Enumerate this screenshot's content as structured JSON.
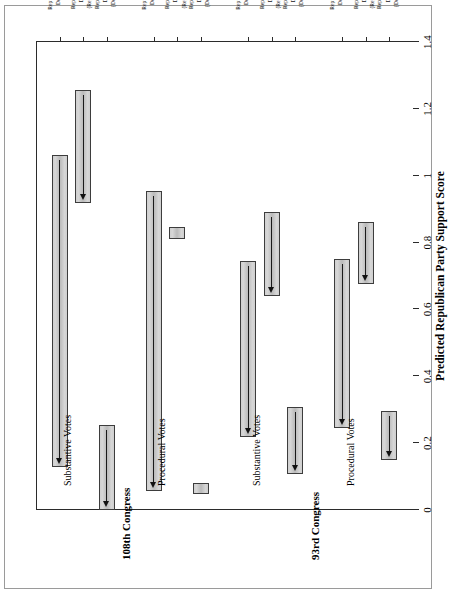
{
  "chart_data": {
    "type": "bar",
    "orientation": "horizontal-rotated",
    "title": "",
    "xlabel": "",
    "ylabel": "Predicted Republican Party Support Score",
    "ylim": [
      0,
      1.4
    ],
    "yticks": [
      0,
      0.2,
      0.4,
      0.6,
      0.8,
      1,
      1.2,
      1.4
    ],
    "ytick_labels": [
      "0",
      "0.2",
      "0.4",
      "0.6",
      "0.8",
      "1",
      "1.2",
      "1.4"
    ],
    "grid": false,
    "legend": "none",
    "panels": [
      {
        "name": "93rd Congress",
        "subpanels": [
          {
            "name": "Procedural Votes",
            "categories": [
              "Republican to\nDemocrat",
              "Rep. to Dem.\nDistrict\n(Republican)",
              "Rep. to Dem.\nDistrict\n(Democrat)"
            ],
            "intervals": [
              {
                "low": 0.245,
                "high": 0.75,
                "estimate": 0.75
              },
              {
                "low": 0.676,
                "high": 0.861,
                "estimate": 0.861
              },
              {
                "low": 0.149,
                "high": 0.297,
                "estimate": 0.297
              }
            ]
          },
          {
            "name": "Substantive Votes",
            "categories": [
              "Republican to\nDemocrat",
              "Rep. to Dem.\nDistrict\n(Republican)",
              "Rep. to Dem.\nDistrict\n(Democrat)"
            ],
            "intervals": [
              {
                "low": 0.219,
                "high": 0.746,
                "estimate": 0.746
              },
              {
                "low": 0.639,
                "high": 0.891,
                "estimate": 0.891
              },
              {
                "low": 0.108,
                "high": 0.308,
                "estimate": 0.308
              }
            ]
          }
        ]
      },
      {
        "name": "108th Congress",
        "subpanels": [
          {
            "name": "Procedural Votes",
            "categories": [
              "Republican to\nDemocrat",
              "Rep. to Dem.\nDistrict\n(Republican)",
              "Rep. to Dem.\nDistrict\n(Democrat)"
            ],
            "intervals": [
              {
                "low": 0.056,
                "high": 0.954,
                "estimate": 0.954
              },
              {
                "low": 0.81,
                "high": 0.847,
                "estimate": null
              },
              {
                "low": 0.048,
                "high": 0.082,
                "estimate": null
              }
            ]
          },
          {
            "name": "Substantive Votes",
            "categories": [
              "Republican to\nDemocrat",
              "Rep. to Dem.\nDistrict\n(Republican)",
              "Rep. to Dem.\nDistrict\n(Democrat)"
            ],
            "intervals": [
              {
                "low": 0.13,
                "high": 1.062,
                "estimate": 1.062
              },
              {
                "low": 0.917,
                "high": 1.255,
                "estimate": 1.255
              },
              {
                "low": 0.0,
                "high": 0.253,
                "estimate": 0.253
              }
            ]
          }
        ]
      }
    ]
  },
  "axis": {
    "value_title": "Predicted Republican Party Support Score",
    "ticks": [
      {
        "label": "0",
        "value": 0
      },
      {
        "label": "0.2",
        "value": 0.2
      },
      {
        "label": "0.4",
        "value": 0.4
      },
      {
        "label": "0.6",
        "value": 0.6
      },
      {
        "label": "0.8",
        "value": 0.8
      },
      {
        "label": "1",
        "value": 1
      },
      {
        "label": "1.2",
        "value": 1.2
      },
      {
        "label": "1.4",
        "value": 1.4
      }
    ]
  },
  "panels": {
    "p0_title": "93rd Congress",
    "p1_title": "108th Congress",
    "s0_title": "Procedural Votes",
    "s1_title": "Substantive Votes",
    "s2_title": "Procedural Votes",
    "s3_title": "Substantive Votes"
  },
  "categories": {
    "c0": "Republican to\nDemocrat",
    "c1": "Rep. to Dem.\nDistrict\n(Republican)",
    "c2": "Rep. to Dem.\nDistrict\n(Democrat)",
    "c3": "Republican to\nDemocrat",
    "c4": "Rep. to Dem.\nDistrict\n(Republican)",
    "c5": "Rep. to Dem.\nDistrict\n(Democrat)",
    "c6": "Republican to\nDemocrat",
    "c7": "Rep. to Dem.\nDistrict\n(Republican)",
    "c8": "Rep. to Dem.\nDistrict\n(Democrat)",
    "c9": "Republican to\nDemocrat",
    "c10": "Rep. to Dem.\nDistrict\n(Republican)",
    "c11": "Rep. to Dem.\nDistrict\n(Democrat)"
  },
  "colors": {
    "bar_fill": "#c6c6c6",
    "bar_border": "#3d3d3d",
    "axis": "#2b2b2b",
    "frame": "#9a9a9a",
    "arrow": "#111111",
    "background": "#ffffff"
  }
}
